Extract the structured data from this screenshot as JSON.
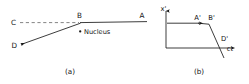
{
  "figure": {
    "title_visible": false,
    "background_color": "#ffffff",
    "ink_color": "#1a1a1a",
    "dash_color": "#6e6e6e",
    "panels": [
      {
        "id": "a",
        "caption": "(a)",
        "description": "Scattering trajectory diagram",
        "labels": {
          "C": "C",
          "B": "B",
          "A": "A",
          "D": "D",
          "nucleus": "Nucleus"
        },
        "points": {
          "C": {
            "x": 14,
            "y": 23
          },
          "B": {
            "x": 82,
            "y": 23
          },
          "A": {
            "x": 145,
            "y": 22
          },
          "D": {
            "x": 17,
            "y": 46
          },
          "nucleus_dot": {
            "x": 80,
            "y": 31
          }
        },
        "segments": [
          {
            "name": "C-to-B-dashed",
            "from": "C",
            "to": "B",
            "style": "dashed"
          },
          {
            "name": "B-to-A-solid",
            "from": "B",
            "to": "A",
            "style": "solid"
          },
          {
            "name": "B-to-D-arrow",
            "from": "B",
            "to": "D",
            "style": "solid-arrow"
          }
        ]
      },
      {
        "id": "b",
        "caption": "(b)",
        "description": "Minkowski spacetime diagram",
        "labels": {
          "y_axis": "x'",
          "x_axis": "ct",
          "A_prime": "A'",
          "B_prime": "B'",
          "D_prime": "D'"
        },
        "axes": {
          "origin": {
            "x": 166,
            "y": 48
          },
          "y_axis_top": {
            "x": 166,
            "y": 9
          },
          "x_axis_right": {
            "x": 234,
            "y": 48
          }
        },
        "points": {
          "A_prime": {
            "x": 198,
            "y": 23
          },
          "B_prime": {
            "x": 210,
            "y": 23
          },
          "D_prime": {
            "x": 220,
            "y": 40
          }
        },
        "segments": [
          {
            "name": "worldline-horizontal",
            "from": "origin-level",
            "to": "B_prime",
            "style": "solid-arrow"
          },
          {
            "name": "worldline-steep-descending",
            "from": "B_prime",
            "through": "D_prime",
            "style": "solid"
          }
        ]
      }
    ]
  }
}
